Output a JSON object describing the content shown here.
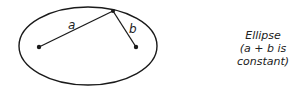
{
  "diagram": {
    "labels": {
      "segment_a": "a",
      "segment_b": "b"
    },
    "caption": {
      "title": "Ellipse",
      "subtitle": "(a + b is constant)"
    },
    "colors": {
      "stroke": "#1a1a1a",
      "text": "#222222",
      "background": "#ffffff"
    }
  }
}
